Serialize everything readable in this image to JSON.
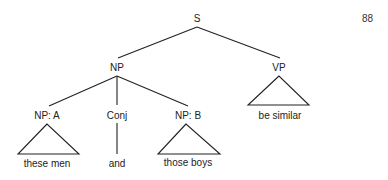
{
  "page_number": "88",
  "tree": {
    "root": "S",
    "np": "NP",
    "vp": "VP",
    "np_a": "NP: A",
    "conj": "Conj",
    "np_b": "NP: B",
    "leaf_np_a": "these men",
    "leaf_conj": "and",
    "leaf_np_b": "those boys",
    "leaf_vp": "be similar"
  },
  "colors": {
    "line": "#222222",
    "text": "#222222",
    "background": "#ffffff"
  }
}
